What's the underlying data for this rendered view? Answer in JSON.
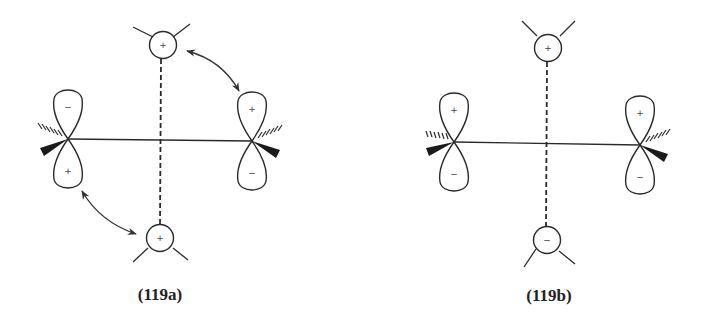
{
  "diagrams": [
    {
      "id": "119a",
      "label": "(119a)",
      "left_orbital": {
        "top_sign": "−",
        "bottom_sign": "+"
      },
      "right_orbital": {
        "top_sign": "+",
        "bottom_sign": "−"
      },
      "top_group": {
        "sign": "+"
      },
      "bottom_group": {
        "sign": "+"
      },
      "arrows": [
        "top-group ↔ right-orbital",
        "bottom-group ↔ left-orbital"
      ]
    },
    {
      "id": "119b",
      "label": "(119b)",
      "left_orbital": {
        "top_sign": "+",
        "bottom_sign": "−"
      },
      "right_orbital": {
        "top_sign": "+",
        "bottom_sign": "−"
      },
      "top_group": {
        "sign": "+"
      },
      "bottom_group": {
        "sign": "−"
      },
      "arrows": []
    }
  ],
  "colors": {
    "ink": "#2a2a2a",
    "background": "#ffffff"
  }
}
